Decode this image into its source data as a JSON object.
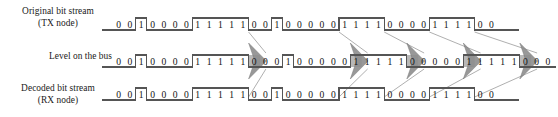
{
  "diagram": {
    "type": "timing-waveform",
    "colors": {
      "line": "#555555",
      "arrow_fill": "#8d8d8d",
      "arrow_edge": "#6f6f6f",
      "stuff_highlight": "#b4b4b4",
      "connector": "#9a9a9a",
      "text": "#141414",
      "background": "#ffffff"
    },
    "geometry": {
      "bit_width_px": 11.3,
      "origin_x_px": 113,
      "row_tx_baseline_y": 30,
      "row_bus_baseline_y": 67,
      "row_rx_baseline_y": 100,
      "wave_amplitude_px": 12
    }
  },
  "labels": {
    "tx": "Original bit stream\n(TX node)",
    "bus": "Level on the bus",
    "rx": "Decoded bit stream\n(RX node)"
  },
  "rows": [
    {
      "name": "original-bit-stream",
      "label_key": "tx",
      "bits": "0010000111110010000011110000111100",
      "stuffed_indices": [],
      "bit_count": 34
    },
    {
      "name": "level-on-the-bus",
      "label_key": "bus",
      "bits": "001000011111000100000111110000011111000",
      "stuffed_indices": [
        12,
        21,
        26,
        31,
        36
      ],
      "bit_count": 39
    },
    {
      "name": "decoded-bit-stream",
      "label_key": "rx",
      "bits": "0010000111110010000011110000111100",
      "stuffed_indices": [],
      "bit_count": 34
    }
  ],
  "stuff_markers": [
    {
      "name": "stuff-marker-1",
      "bus_bit_index": 12,
      "tx_bit_index": 12,
      "rx_bit_index": 12
    },
    {
      "name": "stuff-marker-2",
      "bus_bit_index": 21,
      "tx_bit_index": 20,
      "rx_bit_index": 20
    },
    {
      "name": "stuff-marker-3",
      "bus_bit_index": 26,
      "tx_bit_index": 24,
      "rx_bit_index": 24
    },
    {
      "name": "stuff-marker-4",
      "bus_bit_index": 31,
      "tx_bit_index": 28,
      "rx_bit_index": 28
    },
    {
      "name": "stuff-marker-5",
      "bus_bit_index": 36,
      "tx_bit_index": 32,
      "rx_bit_index": 32
    }
  ]
}
